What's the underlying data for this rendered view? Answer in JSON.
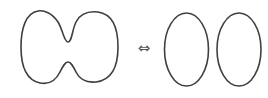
{
  "diagram": {
    "left_figure": {
      "label": "",
      "shape": "pinched-peanut-curve"
    },
    "relation": {
      "symbol": "⇔",
      "meaning": "equivalent-to"
    },
    "right_figure": {
      "label": "",
      "shape": "two-ovals",
      "count": 2
    },
    "colors": {
      "stroke": "#3f3f3f",
      "arrow": "#555555",
      "background": "#ffffff"
    }
  }
}
